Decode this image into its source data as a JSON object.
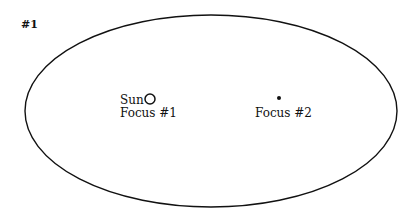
{
  "figure": {
    "label": "#1"
  },
  "ellipse": {
    "cx": 211,
    "cy": 111,
    "rx": 186,
    "ry": 96,
    "stroke": "#111111"
  },
  "focus1": {
    "name": "Sun",
    "label": "Focus #1",
    "x": 150,
    "y": 99
  },
  "focus2": {
    "label": "Focus #2",
    "x": 279,
    "y": 98
  }
}
